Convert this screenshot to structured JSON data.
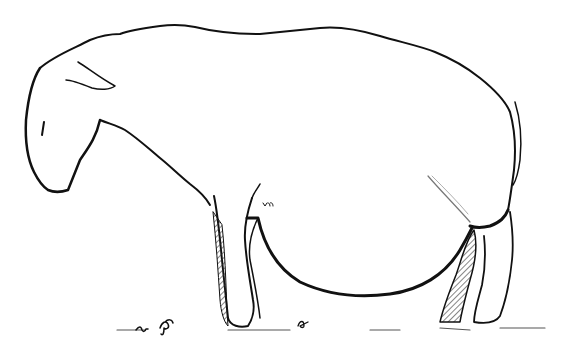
{
  "image": {
    "subject": "Line drawing of a sheep standing in profile, head lowered, facing left",
    "style": "black ink line art on white background with hatched shading on legs",
    "colors": {
      "background": "#ffffff",
      "ink": "#111111",
      "hatch": "#333333"
    }
  }
}
